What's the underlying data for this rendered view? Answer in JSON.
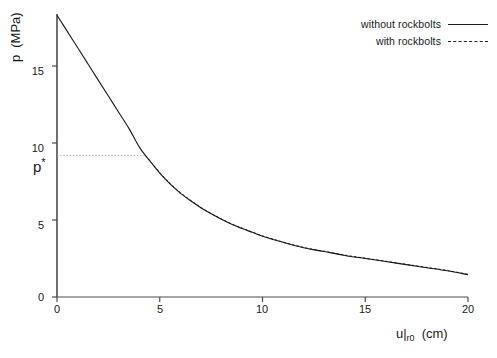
{
  "chart_data": {
    "type": "line",
    "title": "",
    "xlabel": "u|r0  (cm)",
    "ylabel": "p  (MPa)",
    "xlim": [
      0,
      20
    ],
    "ylim": [
      0,
      20
    ],
    "xticks": [
      0,
      5,
      10,
      15,
      20
    ],
    "yticks": [
      0,
      5,
      10,
      15
    ],
    "xtick_labels": [
      "0",
      "5",
      "10",
      "15",
      "20"
    ],
    "ytick_labels": [
      "0",
      "5",
      "10",
      "15"
    ],
    "grid": false,
    "legend_position": "top-right",
    "annotations": [
      {
        "name": "p-star",
        "text": "p*",
        "x": 0,
        "y": 9.2,
        "guide": "dotted horizontal line from y-axis to curve at x = 4.3"
      }
    ],
    "series": [
      {
        "name": "without rockbolts",
        "style": "solid",
        "color": "#1a1a1a",
        "x": [
          0,
          0.5,
          1,
          1.5,
          2,
          2.5,
          3,
          3.5,
          4,
          4.3,
          4.6,
          5,
          5.5,
          6,
          6.5,
          7,
          7.5,
          8,
          8.5,
          9,
          9.5,
          10,
          11,
          12,
          13,
          14,
          15,
          16,
          17,
          18,
          19,
          20
        ],
        "y": [
          18.3,
          17.25,
          16.2,
          15.15,
          14.1,
          13.05,
          12.0,
          10.95,
          9.75,
          9.2,
          8.7,
          8.05,
          7.35,
          6.75,
          6.25,
          5.8,
          5.4,
          5.05,
          4.72,
          4.45,
          4.2,
          3.95,
          3.55,
          3.2,
          2.95,
          2.7,
          2.5,
          2.3,
          2.1,
          1.9,
          1.7,
          1.45
        ]
      },
      {
        "name": "with rockbolts",
        "style": "dashed",
        "color": "#1a1a1a",
        "x": [
          4.3,
          4.6,
          5,
          5.5,
          6,
          6.5,
          7,
          7.5,
          8,
          8.5,
          9,
          9.5,
          10,
          11,
          12,
          13,
          14,
          15,
          16,
          17,
          18,
          19,
          20
        ],
        "y": [
          9.2,
          8.72,
          8.08,
          7.38,
          6.78,
          6.28,
          5.82,
          5.42,
          5.07,
          4.74,
          4.47,
          4.22,
          3.97,
          3.57,
          3.22,
          2.97,
          2.72,
          2.52,
          2.32,
          2.12,
          1.92,
          1.72,
          1.47
        ]
      }
    ]
  },
  "legend": {
    "items": [
      {
        "label": "without rockbolts",
        "style": "solid"
      },
      {
        "label": "with rockbolts",
        "style": "dashed"
      }
    ]
  },
  "axes": {
    "y_title_main": "p",
    "y_title_unit": "(MPa)",
    "x_title_main": "u|",
    "x_title_sub": "r0",
    "x_title_unit": "(cm)"
  },
  "labels": {
    "y0": "0",
    "y5": "5",
    "y10": "10",
    "y15": "15",
    "x0": "0",
    "x5": "5",
    "x10": "10",
    "x15": "15",
    "x20": "20",
    "p_star": "p",
    "p_star_sup": "*"
  }
}
